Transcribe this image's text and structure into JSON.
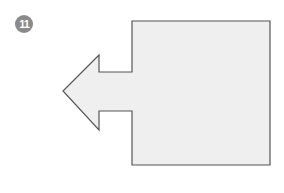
{
  "step": {
    "number": "11",
    "badge_color": "#8a8a8a",
    "text_color": "#ffffff"
  },
  "diagram": {
    "shape": "square-with-left-arrow",
    "fill_color": "#efefef",
    "stroke_color": "#555555",
    "points": "132,21 270,21 270,165 132,165 132,111 99,111 99,130 63,91 99,55 99,72 132,72"
  }
}
